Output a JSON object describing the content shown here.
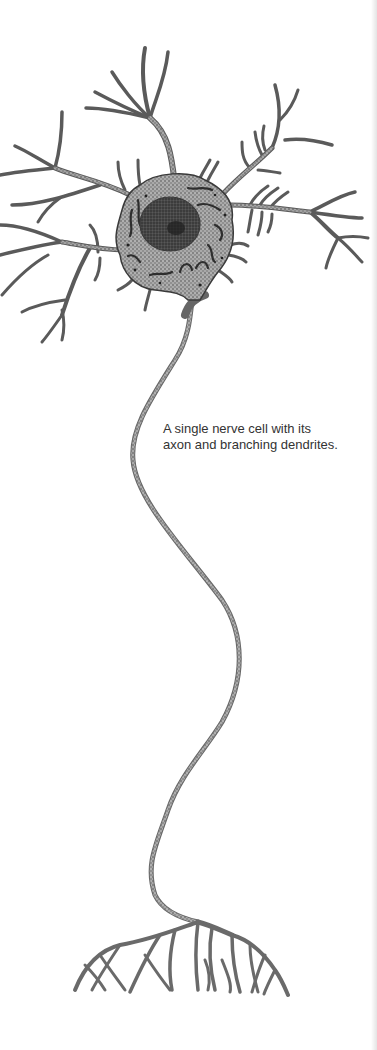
{
  "figure": {
    "caption": {
      "line1": "A single nerve cell with its",
      "line2": "axon and branching dendrites."
    },
    "colors": {
      "background": "#ffffff",
      "stipple": "#6a6a6a",
      "outline": "#3a3a3a",
      "nucleus": "#2e2e2e",
      "caption_text": "#333333"
    }
  }
}
